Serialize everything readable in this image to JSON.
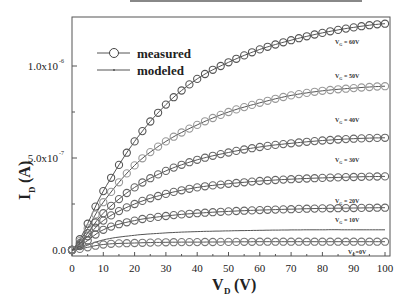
{
  "chart_data": {
    "type": "line",
    "title": "",
    "xlabel": "V_D (V)",
    "ylabel": "I_D (A)",
    "xlim": [
      0,
      102
    ],
    "ylim": [
      -5e-08,
      1.3e-06
    ],
    "xticks": [
      "0",
      "10",
      "20",
      "30",
      "40",
      "50",
      "60",
      "70",
      "80",
      "90",
      "100"
    ],
    "yticks": [
      "0.0",
      "5.0x10^-7",
      "1.0x10^-6"
    ],
    "legend": {
      "position": "upper-left",
      "entries": [
        "measured",
        "modeled"
      ]
    },
    "grid": false,
    "x": [
      0,
      10,
      20,
      30,
      40,
      50,
      60,
      70,
      80,
      90,
      100
    ],
    "series": [
      {
        "name": "measured V_G = 60V",
        "label": "V_G = 60V",
        "values": [
          0,
          3.2e-07,
          5.9e-07,
          7.9e-07,
          9.3e-07,
          1.02e-06,
          1.09e-06,
          1.14e-06,
          1.18e-06,
          1.21e-06,
          1.23e-06
        ]
      },
      {
        "name": "measured V_G = 50V",
        "label": "V_G = 50V",
        "values": [
          0,
          2.6e-07,
          4.6e-07,
          5.9e-07,
          6.8e-07,
          7.5e-07,
          8e-07,
          8.4e-07,
          8.65e-07,
          8.8e-07,
          8.9e-07
        ]
      },
      {
        "name": "measured V_G = 40V",
        "label": "V_G = 40V",
        "values": [
          0,
          2e-07,
          3.4e-07,
          4.3e-07,
          4.9e-07,
          5.3e-07,
          5.6e-07,
          5.8e-07,
          5.95e-07,
          6.05e-07,
          6.1e-07
        ]
      },
      {
        "name": "measured V_G = 30V",
        "label": "V_G = 30V",
        "values": [
          0,
          1.6e-07,
          2.5e-07,
          3.05e-07,
          3.4e-07,
          3.6e-07,
          3.75e-07,
          3.85e-07,
          3.92e-07,
          3.97e-07,
          4e-07
        ]
      },
      {
        "name": "measured V_G = 20V",
        "label": "V_G = 20V",
        "values": [
          0,
          1.1e-07,
          1.6e-07,
          1.85e-07,
          2e-07,
          2.1e-07,
          2.17e-07,
          2.22e-07,
          2.26e-07,
          2.28e-07,
          2.3e-07
        ]
      },
      {
        "name": "modeled V_G = 10V",
        "label": "V_G = 10V",
        "values": [
          0,
          5.5e-08,
          8e-08,
          9.3e-08,
          1e-07,
          1.04e-07,
          1.07e-07,
          1.09e-07,
          1.1e-07,
          1.1e-07,
          1.1e-07
        ]
      },
      {
        "name": "measured V_G = 0V",
        "label": "V_G =0V",
        "values": [
          0,
          3e-08,
          3.8e-08,
          4.2e-08,
          4.3e-08,
          4.4e-08,
          4.5e-08,
          4.5e-08,
          4.5e-08,
          4.5e-08,
          4.5e-08
        ]
      }
    ]
  },
  "legend": {
    "measured": "measured",
    "modeled": "modeled"
  },
  "axes": {
    "xlabel_main": "V",
    "xlabel_sub": "D",
    "xlabel_unit": "(V)",
    "ylabel_main": "I",
    "ylabel_sub": "D",
    "ylabel_unit": "(A)"
  },
  "annotations": [
    {
      "main": "V",
      "sub": "G",
      "rest": " = 60V"
    },
    {
      "main": "V",
      "sub": "G",
      "rest": " = 50V"
    },
    {
      "main": "V",
      "sub": "G",
      "rest": " = 40V"
    },
    {
      "main": "V",
      "sub": "G",
      "rest": " = 30V"
    },
    {
      "main": "V",
      "sub": "G",
      "rest": " = 20V"
    },
    {
      "main": "V",
      "sub": "G",
      "rest": " = 10V"
    },
    {
      "main": "V",
      "sub": "G",
      "rest": "=0V"
    }
  ],
  "ytick_labels": {
    "zero": "0.0",
    "half_base": "5.0x10",
    "half_exp": "-7",
    "one_base": "1.0x10",
    "one_exp": "-6"
  }
}
